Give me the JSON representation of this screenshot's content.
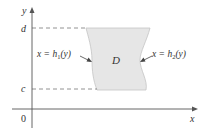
{
  "diagram": {
    "type": "region-between-curves",
    "axes": {
      "x_label": "x",
      "y_label": "y",
      "origin_label": "0"
    },
    "y_bounds": {
      "upper_label": "d",
      "lower_label": "c"
    },
    "region": {
      "label": "D",
      "fill_color": "#e6e6e6",
      "stroke_color": "#bdbdbd"
    },
    "curves": {
      "left": {
        "label_prefix": "x = h",
        "subscript": "1",
        "suffix": "(y)"
      },
      "right": {
        "label_prefix": "x = h",
        "subscript": "2",
        "suffix": "(y)"
      }
    },
    "colors": {
      "axis": "#555555",
      "dash": "#777777",
      "text": "#333333"
    }
  }
}
